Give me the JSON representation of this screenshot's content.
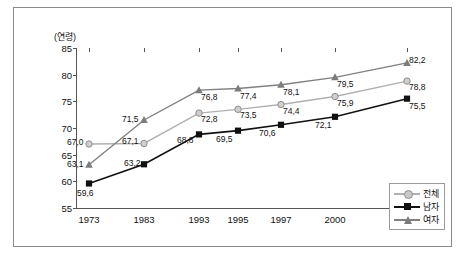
{
  "chart_data": {
    "type": "line",
    "title": "",
    "xlabel": "",
    "ylabel": "(연령)",
    "categories": [
      "1973",
      "1983",
      "1993",
      "1995",
      "1997",
      "2000",
      "2010"
    ],
    "ylim": [
      55,
      85
    ],
    "yticks": [
      "55",
      "60",
      "65",
      "70",
      "75",
      "80",
      "85"
    ],
    "grid": false,
    "legend_position": "bottom-right",
    "series": [
      {
        "name": "전체",
        "marker": "circle",
        "color": "#b0b0b0",
        "values": [
          67.0,
          67.1,
          72.8,
          73.5,
          74.4,
          75.9,
          78.8
        ],
        "labels": [
          "67,0",
          "67,1",
          "72,8",
          "73,5",
          "74,4",
          "75,9",
          "78,8"
        ]
      },
      {
        "name": "남자",
        "marker": "square",
        "color": "#111111",
        "values": [
          59.6,
          63.2,
          68.8,
          69.5,
          70.6,
          72.1,
          75.5
        ],
        "labels": [
          "59,6",
          "63,2",
          "68,8",
          "69,5",
          "70,6",
          "72,1",
          "75,5"
        ]
      },
      {
        "name": "여자",
        "marker": "triangle",
        "color": "#808080",
        "values": [
          63.1,
          71.5,
          77.1,
          77.4,
          78.1,
          79.5,
          82.2
        ],
        "labels": [
          "63,1",
          "71,5",
          "76,8",
          "77,4",
          "78,1",
          "79,5",
          "82,2"
        ]
      }
    ]
  }
}
